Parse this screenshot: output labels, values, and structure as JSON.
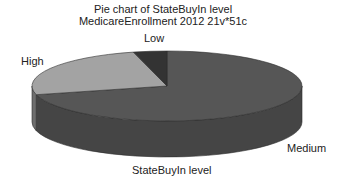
{
  "chart_data": {
    "type": "pie",
    "style": "3d",
    "title": "Pie chart of StateBuyIn level",
    "subtitle": "MedicareEnrollment 2012 21v*51c",
    "xlabel": "StateBuyIn level",
    "ylabel": "",
    "categories": [
      "Medium",
      "High",
      "Low"
    ],
    "values": [
      71,
      25,
      4
    ],
    "unit": "percent (estimated from slice angles)",
    "colors": [
      {
        "top": "#565656",
        "side": "#454545"
      },
      {
        "top": "#a3a3a3",
        "side": "#6e6e6e"
      },
      {
        "top": "#333333",
        "side": "#262626"
      }
    ],
    "legend": "none (labels placed next to slices)"
  }
}
